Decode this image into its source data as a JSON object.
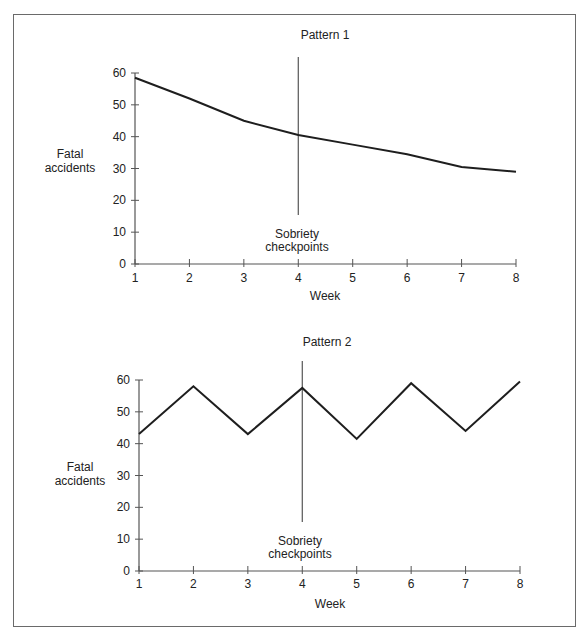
{
  "figure": {
    "frame_color": "#6a6a6a",
    "line_color": "#1e1e1e",
    "axis_color": "#555555"
  },
  "chart_data": [
    {
      "type": "line",
      "title": "Pattern 1",
      "xlabel": "Week",
      "ylabel": "Fatal accidents",
      "x": [
        1,
        2,
        3,
        4,
        5,
        6,
        7,
        8
      ],
      "x_tick_labels": [
        "1",
        "2",
        "3",
        "4",
        "5",
        "6",
        "7",
        "8"
      ],
      "y_tick_labels": [
        "0",
        "10",
        "20",
        "30",
        "40",
        "50",
        "60"
      ],
      "ylim": [
        0,
        60
      ],
      "xlim": [
        1,
        8
      ],
      "grid": false,
      "series": [
        {
          "name": "Fatal accidents",
          "values": [
            58.5,
            52,
            45,
            40.5,
            37.5,
            34.5,
            30.5,
            29
          ]
        }
      ],
      "annotations": [
        {
          "type": "vertical_line",
          "x": 4,
          "label_line1": "Sobriety",
          "label_line2": "checkpoints"
        }
      ]
    },
    {
      "type": "line",
      "title": "Pattern 2",
      "xlabel": "Week",
      "ylabel": "Fatal accidents",
      "x": [
        1,
        2,
        3,
        4,
        5,
        6,
        7,
        8
      ],
      "x_tick_labels": [
        "1",
        "2",
        "3",
        "4",
        "5",
        "6",
        "7",
        "8"
      ],
      "y_tick_labels": [
        "0",
        "10",
        "20",
        "30",
        "40",
        "50",
        "60"
      ],
      "ylim": [
        0,
        60
      ],
      "xlim": [
        1,
        8
      ],
      "grid": false,
      "series": [
        {
          "name": "Fatal accidents",
          "values": [
            43,
            58,
            43,
            57.5,
            41.5,
            59,
            44,
            59.5
          ]
        }
      ],
      "annotations": [
        {
          "type": "vertical_line",
          "x": 4,
          "label_line1": "Sobriety",
          "label_line2": "checkpoints"
        }
      ]
    }
  ],
  "charts": [
    {
      "title": "Pattern 1",
      "ylabel_line1": "Fatal",
      "ylabel_line2": "accidents",
      "xlabel": "Week",
      "checkpoint_line1": "Sobriety",
      "checkpoint_line2": "checkpoints"
    },
    {
      "title": "Pattern 2",
      "ylabel_line1": "Fatal",
      "ylabel_line2": "accidents",
      "xlabel": "Week",
      "checkpoint_line1": "Sobriety",
      "checkpoint_line2": "checkpoints"
    }
  ]
}
